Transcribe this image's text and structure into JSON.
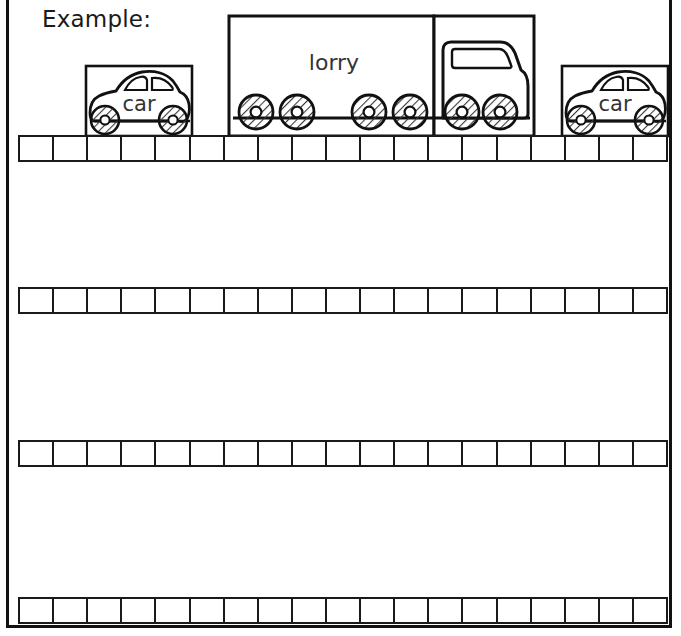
{
  "worksheet": {
    "heading": "Example:",
    "grid": {
      "columns": 19,
      "rows": 4,
      "row_labels": [
        "row-1",
        "row-2",
        "row-3",
        "row-4"
      ]
    },
    "colors": {
      "ink": "#1a1a1a",
      "paper": "#ffffff",
      "wheel_hatch": "#555555"
    },
    "vehicles": [
      {
        "id": "car-left",
        "type": "car",
        "label": "car",
        "wheels": 2,
        "boxed": true
      },
      {
        "id": "lorry",
        "type": "lorry",
        "label": "lorry",
        "wheels": 6,
        "boxed": true,
        "parts": [
          "trailer",
          "cab"
        ]
      },
      {
        "id": "car-right",
        "type": "car",
        "label": "car",
        "wheels": 2,
        "boxed": true
      }
    ]
  }
}
